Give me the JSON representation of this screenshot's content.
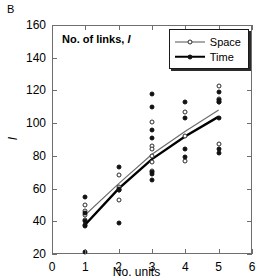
{
  "panel_label": "B",
  "chart_data": {
    "type": "scatter",
    "title": "No. of links, l",
    "title_plain": "No. of links,",
    "title_italic": "l",
    "xlabel": "No. units",
    "ylabel": "l",
    "xlim": [
      0,
      6
    ],
    "ylim": [
      20,
      160
    ],
    "xticks": [
      0,
      1,
      2,
      3,
      4,
      5,
      6
    ],
    "yticks": [
      20,
      40,
      60,
      80,
      100,
      120,
      140,
      160
    ],
    "grid": false,
    "legend_position": "top-right",
    "legend": [
      {
        "name": "Space",
        "marker": "open-circle",
        "line": "thin"
      },
      {
        "name": "Time",
        "marker": "filled-circle",
        "line": "thick"
      }
    ],
    "series": [
      {
        "name": "Space",
        "marker": "open-circle",
        "points": [
          {
            "x": 1,
            "y": 50
          },
          {
            "x": 1,
            "y": 46
          },
          {
            "x": 1,
            "y": 44
          },
          {
            "x": 1,
            "y": 41
          },
          {
            "x": 2,
            "y": 68
          },
          {
            "x": 2,
            "y": 61
          },
          {
            "x": 2,
            "y": 59
          },
          {
            "x": 2,
            "y": 53
          },
          {
            "x": 3,
            "y": 101
          },
          {
            "x": 3,
            "y": 86
          },
          {
            "x": 3,
            "y": 84
          },
          {
            "x": 3,
            "y": 80
          },
          {
            "x": 3,
            "y": 76
          },
          {
            "x": 3,
            "y": 71
          },
          {
            "x": 4,
            "y": 107
          },
          {
            "x": 4,
            "y": 92
          },
          {
            "x": 4,
            "y": 77
          },
          {
            "x": 5,
            "y": 123
          },
          {
            "x": 5,
            "y": 115
          },
          {
            "x": 5,
            "y": 113
          },
          {
            "x": 5,
            "y": 87
          }
        ]
      },
      {
        "name": "Time",
        "marker": "filled-circle",
        "points": [
          {
            "x": 1,
            "y": 55
          },
          {
            "x": 1,
            "y": 45
          },
          {
            "x": 1,
            "y": 40
          },
          {
            "x": 1,
            "y": 38
          },
          {
            "x": 1,
            "y": 37
          },
          {
            "x": 1,
            "y": 21
          },
          {
            "x": 2,
            "y": 73
          },
          {
            "x": 2,
            "y": 60
          },
          {
            "x": 2,
            "y": 59
          },
          {
            "x": 2,
            "y": 39
          },
          {
            "x": 3,
            "y": 118
          },
          {
            "x": 3,
            "y": 110
          },
          {
            "x": 3,
            "y": 96
          },
          {
            "x": 3,
            "y": 91
          },
          {
            "x": 3,
            "y": 70
          },
          {
            "x": 3,
            "y": 69
          },
          {
            "x": 3,
            "y": 65
          },
          {
            "x": 4,
            "y": 113
          },
          {
            "x": 4,
            "y": 103
          },
          {
            "x": 4,
            "y": 84
          },
          {
            "x": 4,
            "y": 79
          },
          {
            "x": 5,
            "y": 119
          },
          {
            "x": 5,
            "y": 114
          },
          {
            "x": 5,
            "y": 113
          },
          {
            "x": 5,
            "y": 103
          },
          {
            "x": 5,
            "y": 84
          },
          {
            "x": 5,
            "y": 82
          }
        ]
      }
    ],
    "fit_lines": [
      {
        "name": "Space",
        "style": "thin",
        "x": [
          1,
          2,
          3,
          4,
          5
        ],
        "y": [
          44,
          63,
          81,
          95,
          108
        ]
      },
      {
        "name": "Time",
        "style": "thick",
        "x": [
          1,
          2,
          3,
          4,
          5
        ],
        "y": [
          38,
          60,
          78,
          92,
          104
        ]
      }
    ]
  }
}
